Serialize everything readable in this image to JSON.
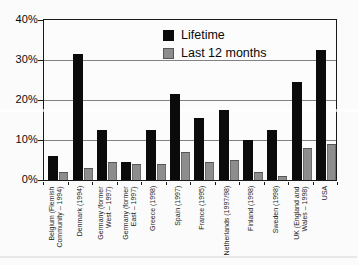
{
  "chart_data": {
    "type": "bar",
    "title": "",
    "xlabel": "",
    "ylabel": "",
    "ylim": [
      0,
      40
    ],
    "grid": true,
    "legend_position": "top-center-inside",
    "yticks": [
      {
        "value": 0,
        "label": "0%"
      },
      {
        "value": 10,
        "label": "10%"
      },
      {
        "value": 20,
        "label": "20%"
      },
      {
        "value": 30,
        "label": "30%"
      },
      {
        "value": 40,
        "label": "40%"
      }
    ],
    "categories": [
      "Belgium (Flemish Community – 1994)",
      "Denmark (1994)",
      "Germany (former West – 1997)",
      "Germany (former East – 1997)",
      "Greece (1998)",
      "Spain (1997)",
      "France (1995)",
      "Netherlands (1997/98)",
      "Finland (1998)",
      "Sweden (1998)",
      "UK (England and Wales – 1998)",
      "USA"
    ],
    "category_label_lines": [
      [
        "Belgium (Flemish",
        "Community – 1994)"
      ],
      [
        "Denmark (1994)"
      ],
      [
        "Germany (former",
        "West – 1997)"
      ],
      [
        "Germany (former",
        "East – 1997)"
      ],
      [
        "Greece (1998)"
      ],
      [
        "Spain (1997)"
      ],
      [
        "France (1995)"
      ],
      [
        "Netherlands (1997/98)"
      ],
      [
        "Finland (1998)"
      ],
      [
        "Sweden (1998)"
      ],
      [
        "UK (England and",
        "Wales – 1998)"
      ],
      [
        "USA"
      ]
    ],
    "series": [
      {
        "name": "Lifetime",
        "color": "#0b0b0b",
        "values": [
          6,
          31.5,
          12.5,
          4.5,
          12.5,
          21.5,
          15.5,
          17.5,
          10,
          12.5,
          24.5,
          32.5
        ]
      },
      {
        "name": "Last 12 months",
        "color": "#8d8d8d",
        "values": [
          2,
          3,
          4.5,
          4,
          4,
          7,
          4.5,
          5,
          2,
          1,
          8,
          9
        ]
      }
    ]
  }
}
